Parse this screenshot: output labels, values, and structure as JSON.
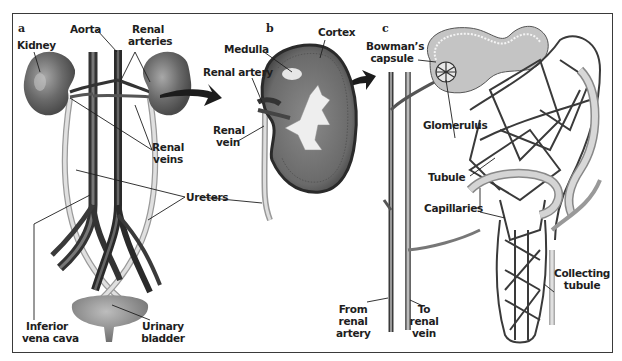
{
  "figure": {
    "panels": [
      {
        "letter": "a",
        "labels": {
          "kidney": "Kidney",
          "aorta": "Aorta",
          "renal_arteries_1": "Renal",
          "renal_arteries_2": "arteries",
          "renal_veins_1": "Renal",
          "renal_veins_2": "veins",
          "ureters": "Ureters",
          "inferior_vena_cava_1": "Inferior",
          "inferior_vena_cava_2": "vena cava",
          "urinary_bladder_1": "Urinary",
          "urinary_bladder_2": "bladder"
        }
      },
      {
        "letter": "b",
        "labels": {
          "cortex": "Cortex",
          "medulla": "Medulla",
          "renal_artery": "Renal artery",
          "renal_vein_1": "Renal",
          "renal_vein_2": "vein"
        }
      },
      {
        "letter": "c",
        "labels": {
          "bowmans_capsule_1": "Bowman’s",
          "bowmans_capsule_2": "capsule",
          "glomerulus": "Glomerulus",
          "tubule": "Tubule",
          "capillaries": "Capillaries",
          "collecting_tubule_1": "Collecting",
          "collecting_tubule_2": "tubule",
          "from_renal_artery_1": "From",
          "from_renal_artery_2": "renal",
          "from_renal_artery_3": "artery",
          "to_renal_vein_1": "To",
          "to_renal_vein_2": "renal",
          "to_renal_vein_3": "vein"
        }
      }
    ],
    "colors": {
      "frame": "#3a3a3a",
      "kidney": "#6e6e6e",
      "vessel_dark": "#3c3c3c",
      "ureter": "#c8c8c8",
      "capsule": "#b8b8b8",
      "text": "#1e1e1e"
    }
  }
}
